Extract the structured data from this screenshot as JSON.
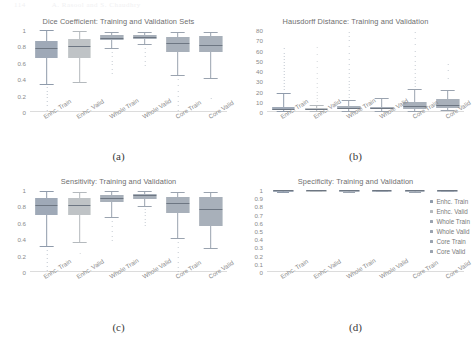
{
  "page_header": [
    "114",
    "A. Rasool and S. Chaudhry"
  ],
  "series_labels": [
    "Enhc. Train",
    "Enhc. Valid",
    "Whole Train",
    "Whole Valid",
    "Core Train",
    "Core Valid"
  ],
  "colors": {
    "enhc_train": "#8f9bab",
    "enhc_valid": "#b4b9bd",
    "whole_train": "#9aa3af",
    "whole_valid": "#9aa3af",
    "core_train": "#9aa3af",
    "core_valid": "#9aa3af",
    "axis": "#dcdcdc",
    "text": "#8a8a8a",
    "title": "#6e6e6e"
  },
  "legend": {
    "items": [
      {
        "label": "Enhc. Train",
        "color": "#8f9bab"
      },
      {
        "label": "Enhc. Valid",
        "color": "#b4b9bd"
      },
      {
        "label": "Whole Train",
        "color": "#9aa3af"
      },
      {
        "label": "Whole Valid",
        "color": "#9aa3af"
      },
      {
        "label": "Core Train",
        "color": "#9aa3af"
      },
      {
        "label": "Core Valid",
        "color": "#9aa3af"
      }
    ]
  },
  "captions": {
    "a": "(a)",
    "b": "(b)",
    "c": "(c)",
    "d": "(d)"
  },
  "chart_data": [
    {
      "type": "box",
      "panel": "a",
      "title": "Dice Coefficient: Training and Validation Sets",
      "xlabel": "",
      "ylabel": "",
      "ylim": [
        0,
        1
      ],
      "yticks": [
        0,
        0.2,
        0.4,
        0.6,
        0.8,
        1
      ],
      "ytick_labels": [
        "0",
        "0.2",
        "0.4",
        "0.6",
        "0.8",
        "1"
      ],
      "grid": false,
      "categories": [
        "Enhc. Train",
        "Enhc. Valid",
        "Whole Train",
        "Whole Valid",
        "Core Train",
        "Core Valid"
      ],
      "boxes": [
        {
          "name": "Enhc. Train",
          "min": 0.34,
          "q1": 0.655,
          "median": 0.785,
          "q3": 0.865,
          "max": 1.0,
          "outliers": [
            0.3,
            0.26,
            0.22,
            0.18,
            0.13,
            0.08,
            0.03
          ]
        },
        {
          "name": "Enhc. Valid",
          "min": 0.36,
          "q1": 0.655,
          "median": 0.8,
          "q3": 0.895,
          "max": 0.99,
          "outliers": []
        },
        {
          "name": "Whole Train",
          "min": 0.78,
          "q1": 0.875,
          "median": 0.905,
          "q3": 0.935,
          "max": 0.97,
          "outliers": [
            0.73,
            0.68,
            0.62,
            0.58,
            0.52,
            0.48
          ]
        },
        {
          "name": "Whole Valid",
          "min": 0.83,
          "q1": 0.885,
          "median": 0.915,
          "q3": 0.94,
          "max": 0.97,
          "outliers": [
            0.78,
            0.73,
            0.68,
            0.62,
            0.57
          ]
        },
        {
          "name": "Core Train",
          "min": 0.455,
          "q1": 0.735,
          "median": 0.845,
          "q3": 0.915,
          "max": 0.97,
          "outliers": [
            0.4,
            0.33,
            0.26,
            0.2,
            0.14,
            0.08,
            0.02
          ]
        },
        {
          "name": "Core Valid",
          "min": 0.41,
          "q1": 0.73,
          "median": 0.815,
          "q3": 0.925,
          "max": 0.98,
          "outliers": [
            0.17
          ]
        }
      ]
    },
    {
      "type": "box",
      "panel": "b",
      "title": "Hausdorff Distance: Training and Validation",
      "xlabel": "",
      "ylabel": "",
      "ylim": [
        0,
        80
      ],
      "yticks": [
        0,
        10,
        20,
        30,
        40,
        50,
        60,
        70,
        80
      ],
      "ytick_labels": [
        "0",
        "10",
        "20",
        "30",
        "40",
        "50",
        "60",
        "70",
        "80"
      ],
      "grid": false,
      "categories": [
        "Enhc. Train",
        "Enhc. Valid",
        "Whole Train",
        "Whole Valid",
        "Core Train",
        "Core Valid"
      ],
      "boxes": [
        {
          "name": "Enhc. Train",
          "min": 0.5,
          "q1": 2.0,
          "median": 3.0,
          "q3": 4.5,
          "max": 19.0,
          "outliers": [
            22,
            25,
            28,
            31,
            34,
            37,
            40,
            43,
            46,
            49,
            52,
            55,
            58,
            62
          ]
        },
        {
          "name": "Enhc. Valid",
          "min": 0.5,
          "q1": 1.5,
          "median": 2.5,
          "q3": 3.5,
          "max": 7.0,
          "outliers": [
            11,
            14,
            17,
            20,
            24,
            28,
            33,
            38,
            44,
            50,
            57,
            63
          ]
        },
        {
          "name": "Whole Train",
          "min": 1.0,
          "q1": 2.5,
          "median": 4.0,
          "q3": 6.0,
          "max": 12.0,
          "outliers": [
            15,
            18,
            21,
            24,
            27,
            30,
            34,
            38,
            42,
            47,
            52,
            58,
            64,
            70,
            74,
            78
          ]
        },
        {
          "name": "Whole Valid",
          "min": 1.0,
          "q1": 2.5,
          "median": 3.5,
          "q3": 5.0,
          "max": 14.0,
          "outliers": []
        },
        {
          "name": "Core Train",
          "min": 1.0,
          "q1": 3.0,
          "median": 5.5,
          "q3": 9.5,
          "max": 22.0,
          "outliers": [
            25,
            28,
            31,
            34,
            38,
            42,
            46,
            50,
            55,
            60,
            66,
            72,
            78
          ]
        },
        {
          "name": "Core Valid",
          "min": 1.5,
          "q1": 4.0,
          "median": 7.0,
          "q3": 12.5,
          "max": 21.0,
          "outliers": [
            33,
            41,
            47
          ]
        }
      ]
    },
    {
      "type": "box",
      "panel": "c",
      "title": "Sensitivity: Training and Validation",
      "xlabel": "",
      "ylabel": "",
      "ylim": [
        0,
        1
      ],
      "yticks": [
        0,
        0.2,
        0.4,
        0.6,
        0.8,
        1
      ],
      "ytick_labels": [
        "0",
        "0.2",
        "0.4",
        "0.6",
        "0.8",
        "1"
      ],
      "grid": false,
      "categories": [
        "Enhc. Train",
        "Enhc. Valid",
        "Whole Train",
        "Whole Valid",
        "Core Train",
        "Core Valid"
      ],
      "boxes": [
        {
          "name": "Enhc. Train",
          "min": 0.32,
          "q1": 0.695,
          "median": 0.815,
          "q3": 0.905,
          "max": 0.99,
          "outliers": [
            0.27,
            0.22,
            0.17,
            0.12,
            0.07,
            0.02
          ]
        },
        {
          "name": "Enhc. Valid",
          "min": 0.36,
          "q1": 0.695,
          "median": 0.815,
          "q3": 0.905,
          "max": 0.98,
          "outliers": [
            0.23
          ]
        },
        {
          "name": "Whole Train",
          "min": 0.665,
          "q1": 0.855,
          "median": 0.905,
          "q3": 0.945,
          "max": 0.99,
          "outliers": [
            0.62,
            0.56,
            0.5,
            0.44,
            0.39
          ]
        },
        {
          "name": "Whole Valid",
          "min": 0.81,
          "q1": 0.895,
          "median": 0.935,
          "q3": 0.955,
          "max": 0.99,
          "outliers": [
            0.77,
            0.73,
            0.69,
            0.65,
            0.61,
            0.57
          ]
        },
        {
          "name": "Core Train",
          "min": 0.41,
          "q1": 0.715,
          "median": 0.845,
          "q3": 0.92,
          "max": 0.97,
          "outliers": [
            0.36,
            0.3,
            0.24,
            0.18,
            0.12,
            0.06,
            0.01
          ]
        },
        {
          "name": "Core Valid",
          "min": 0.29,
          "q1": 0.555,
          "median": 0.765,
          "q3": 0.915,
          "max": 0.98,
          "outliers": []
        }
      ]
    },
    {
      "type": "box",
      "panel": "d",
      "title": "Specificity: Training and Validation",
      "xlabel": "",
      "ylabel": "",
      "ylim": [
        0,
        1
      ],
      "yticks": [
        0,
        0.1,
        0.2,
        0.3,
        0.4,
        0.5,
        0.6,
        0.7,
        0.8,
        0.9,
        1
      ],
      "ytick_labels": [
        "0",
        "0.1",
        "0.2",
        "0.3",
        "0.4",
        "0.5",
        "0.6",
        "0.7",
        "0.8",
        "0.9",
        "1"
      ],
      "grid": false,
      "categories": [
        "Enhc. Train",
        "Enhc. Valid",
        "Whole Train",
        "Whole Valid",
        "Core Train",
        "Core Valid"
      ],
      "boxes": [
        {
          "name": "Enhc. Train",
          "min": 0.978,
          "q1": 0.997,
          "median": 0.999,
          "q3": 1.0,
          "max": 1.0,
          "outliers": []
        },
        {
          "name": "Enhc. Valid",
          "min": 0.992,
          "q1": 0.998,
          "median": 0.999,
          "q3": 1.0,
          "max": 1.0,
          "outliers": []
        },
        {
          "name": "Whole Train",
          "min": 0.975,
          "q1": 0.995,
          "median": 0.998,
          "q3": 1.0,
          "max": 1.0,
          "outliers": []
        },
        {
          "name": "Whole Valid",
          "min": 0.99,
          "q1": 0.996,
          "median": 0.998,
          "q3": 1.0,
          "max": 1.0,
          "outliers": []
        },
        {
          "name": "Core Train",
          "min": 0.97,
          "q1": 0.994,
          "median": 0.998,
          "q3": 1.0,
          "max": 1.0,
          "outliers": []
        },
        {
          "name": "Core Valid",
          "min": 0.988,
          "q1": 0.997,
          "median": 0.999,
          "q3": 1.0,
          "max": 1.0,
          "outliers": []
        }
      ]
    }
  ]
}
